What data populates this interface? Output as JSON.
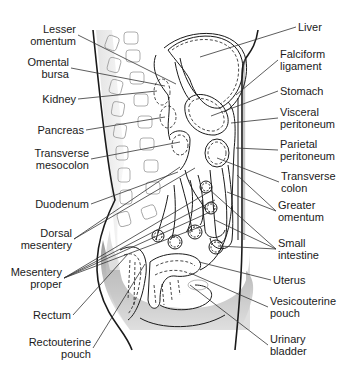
{
  "labels_left": [
    {
      "id": "lesser-omentum",
      "text": "Lesser\nomentum",
      "x": 76,
      "y": 23,
      "tx": 176,
      "ty": 84
    },
    {
      "id": "omental-bursa",
      "text": "Omental\nbursa",
      "x": 69,
      "y": 56,
      "tx": 165,
      "ty": 86
    },
    {
      "id": "kidney",
      "text": "Kidney",
      "x": 76,
      "y": 93,
      "tx": 157,
      "ty": 91
    },
    {
      "id": "pancreas",
      "text": "Pancreas",
      "x": 84,
      "y": 124,
      "tx": 165,
      "ty": 117
    },
    {
      "id": "transverse-mesocolon",
      "text": "Transverse\nmesocolon",
      "x": 89,
      "y": 147,
      "tx": 180,
      "ty": 142
    },
    {
      "id": "duodenum",
      "text": "Duodenum",
      "x": 89,
      "y": 198,
      "tx": 178,
      "ty": 172
    },
    {
      "id": "dorsal-mesentery",
      "text": "Dorsal\nmesentery",
      "x": 72,
      "y": 227,
      "tx": 180,
      "ty": 167
    },
    {
      "id": "mesentery-proper",
      "text": "Mesentery\nproper",
      "x": 62,
      "y": 266,
      "tx": 210,
      "ty": 212
    },
    {
      "id": "rectum",
      "text": "Rectum",
      "x": 71,
      "y": 309,
      "tx": 128,
      "ty": 254
    },
    {
      "id": "rectouterine-pouch",
      "text": "Rectouterine\npouch",
      "x": 91,
      "y": 336,
      "tx": 145,
      "ty": 264
    }
  ],
  "labels_right": [
    {
      "id": "liver",
      "text": "Liver",
      "x": 298,
      "y": 21,
      "tx": 200,
      "ty": 57
    },
    {
      "id": "falciform-ligament",
      "text": "Falciform\nligament",
      "x": 280,
      "y": 48,
      "tx": 236,
      "ty": 95
    },
    {
      "id": "stomach",
      "text": "Stomach",
      "x": 280,
      "y": 85,
      "tx": 211,
      "ty": 116
    },
    {
      "id": "visceral-peritoneum",
      "text": "Visceral\nperitoneum",
      "x": 280,
      "y": 106,
      "tx": 231,
      "ty": 123
    },
    {
      "id": "parietal-peritoneum",
      "text": "Parietal\nperitoneum",
      "x": 280,
      "y": 138,
      "tx": 236,
      "ty": 148
    },
    {
      "id": "transverse-colon",
      "text": "Transverse\ncolon",
      "x": 281,
      "y": 170,
      "tx": 217,
      "ty": 158
    },
    {
      "id": "greater-omentum",
      "text": "Greater\nomentum",
      "x": 278,
      "y": 199,
      "tx": 227,
      "ty": 192
    },
    {
      "id": "small-intestine",
      "text": "Small\nintestine",
      "x": 278,
      "y": 237,
      "tx": 218,
      "ty": 246
    },
    {
      "id": "uterus",
      "text": "Uterus",
      "x": 273,
      "y": 274,
      "tx": 199,
      "ty": 262
    },
    {
      "id": "vesicouterine-pouch",
      "text": "Vesicouterine\npouch",
      "x": 270,
      "y": 295,
      "tx": 190,
      "ty": 273
    },
    {
      "id": "urinary-bladder",
      "text": "Urinary\nbladder",
      "x": 270,
      "y": 333,
      "tx": 190,
      "ty": 285
    }
  ],
  "extra_leaders": [
    {
      "label": "dorsal-mesentery",
      "tx": 195,
      "ty": 168
    },
    {
      "label": "mesentery-proper",
      "tx": 215,
      "ty": 200
    },
    {
      "label": "mesentery-proper",
      "tx": 212,
      "ty": 190
    },
    {
      "label": "mesentery-proper",
      "tx": 205,
      "ty": 225
    },
    {
      "label": "greater-omentum",
      "tx": 237,
      "ty": 175
    },
    {
      "label": "small-intestine",
      "tx": 215,
      "ty": 220
    },
    {
      "label": "small-intestine",
      "tx": 210,
      "ty": 190
    }
  ],
  "colors": {
    "ink": "#1a1a1a",
    "leader": "#333333",
    "shade": "#bdbdbd",
    "vertebra": "#9a9a9a"
  }
}
